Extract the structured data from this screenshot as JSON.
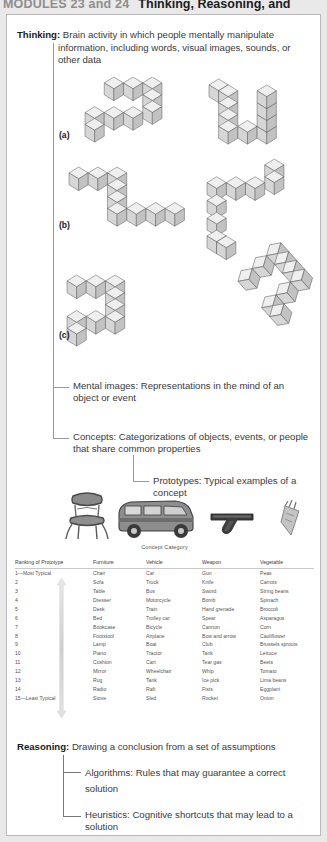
{
  "header": {
    "modules_label": "MODULES 23 and 24",
    "title": "Thinking, Reasoning, and"
  },
  "thinking": {
    "term": "Thinking:",
    "definition": "Brain activity in which people mentally manipulate information, including words, visual images, sounds, or other data",
    "figure_labels": [
      "(a)",
      "(b)",
      "(c)"
    ],
    "figure_caption_note": "mental-rotation block pairs"
  },
  "branches": [
    {
      "name": "mental-images",
      "text": "Mental images: Representations in the mind of an object or event"
    },
    {
      "name": "concepts",
      "text": "Concepts: Categorizations of objects, events, or people that share common properties"
    },
    {
      "name": "prototypes",
      "text": "Prototypes: Typical examples of a concept"
    }
  ],
  "photos": [
    {
      "name": "chair-photo",
      "alt": "chair"
    },
    {
      "name": "car-photo",
      "alt": "car"
    },
    {
      "name": "gun-photo",
      "alt": "handgun"
    },
    {
      "name": "vegetable-photo",
      "alt": "vegetable"
    }
  ],
  "table": {
    "caption": "Concept Category",
    "columns": [
      "Ranking of Prototype",
      "Furniture",
      "Vehicle",
      "Weapon",
      "Vegetable"
    ],
    "rows": [
      [
        "1—Most Typical",
        "Chair",
        "Car",
        "Gun",
        "Peas"
      ],
      [
        "2",
        "Sofa",
        "Truck",
        "Knife",
        "Carrots"
      ],
      [
        "3",
        "Table",
        "Bus",
        "Sword",
        "String beans"
      ],
      [
        "4",
        "Dresser",
        "Motorcycle",
        "Bomb",
        "Spinach"
      ],
      [
        "5",
        "Desk",
        "Train",
        "Hand grenade",
        "Broccoli"
      ],
      [
        "6",
        "Bed",
        "Trolley car",
        "Spear",
        "Asparagus"
      ],
      [
        "7",
        "Bookcase",
        "Bicycle",
        "Cannon",
        "Corn"
      ],
      [
        "8",
        "Footstool",
        "Airplane",
        "Bow and arrow",
        "Cauliflower"
      ],
      [
        "9",
        "Lamp",
        "Boat",
        "Club",
        "Brussels sprouts"
      ],
      [
        "10",
        "Piano",
        "Tractor",
        "Tank",
        "Lettuce"
      ],
      [
        "11",
        "Cushion",
        "Cart",
        "Tear gas",
        "Beets"
      ],
      [
        "12",
        "Mirror",
        "Wheelchair",
        "Whip",
        "Tomato"
      ],
      [
        "13",
        "Rug",
        "Tank",
        "Ice pick",
        "Lima beans"
      ],
      [
        "14",
        "Radio",
        "Raft",
        "Fists",
        "Eggplant"
      ],
      [
        "15—Least Typical",
        "Stove",
        "Sled",
        "Rocket",
        "Onion"
      ]
    ]
  },
  "reasoning": {
    "term": "Reasoning:",
    "definition": "Drawing a conclusion from a set of assumptions",
    "branches": [
      {
        "name": "algorithms",
        "text": "Algorithms: Rules that may guarantee a correct solution"
      },
      {
        "name": "heuristics",
        "text": "Heuristics: Cognitive shortcuts that may lead to a solution"
      }
    ]
  },
  "colors": {
    "page_background": "#e9e9e9",
    "panel_background": "#ffffff",
    "panel_border": "#b9b9b9",
    "text": "#3a3a3a",
    "heading_muted": "#8e8e8e",
    "connector_line": "#999999",
    "block_face_top": "#f0f0f0",
    "block_face_front": "#d3d3d3",
    "block_face_side": "#bdbdbd"
  }
}
